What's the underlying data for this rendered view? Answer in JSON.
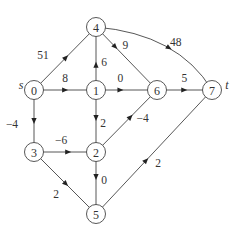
{
  "graph": {
    "type": "directed-weighted-graph",
    "nodes": [
      {
        "id": "0",
        "label": "0",
        "tag": "s"
      },
      {
        "id": "1",
        "label": "1"
      },
      {
        "id": "2",
        "label": "2"
      },
      {
        "id": "3",
        "label": "3"
      },
      {
        "id": "4",
        "label": "4"
      },
      {
        "id": "5",
        "label": "5"
      },
      {
        "id": "6",
        "label": "6"
      },
      {
        "id": "7",
        "label": "7",
        "tag": "t"
      }
    ],
    "edges": [
      {
        "from": "0",
        "to": "4",
        "weight": "51"
      },
      {
        "from": "0",
        "to": "1",
        "weight": "8"
      },
      {
        "from": "0",
        "to": "3",
        "weight": "−4"
      },
      {
        "from": "1",
        "to": "4",
        "weight": "6"
      },
      {
        "from": "1",
        "to": "6",
        "weight": "0"
      },
      {
        "from": "1",
        "to": "2",
        "weight": "2"
      },
      {
        "from": "4",
        "to": "6",
        "weight": "9"
      },
      {
        "from": "4",
        "to": "7",
        "weight": "48"
      },
      {
        "from": "6",
        "to": "7",
        "weight": "5"
      },
      {
        "from": "2",
        "to": "6",
        "weight": "−4"
      },
      {
        "from": "3",
        "to": "2",
        "weight": "−6"
      },
      {
        "from": "3",
        "to": "5",
        "weight": "2"
      },
      {
        "from": "2",
        "to": "5",
        "weight": "0"
      },
      {
        "from": "5",
        "to": "7",
        "weight": "2"
      }
    ]
  }
}
